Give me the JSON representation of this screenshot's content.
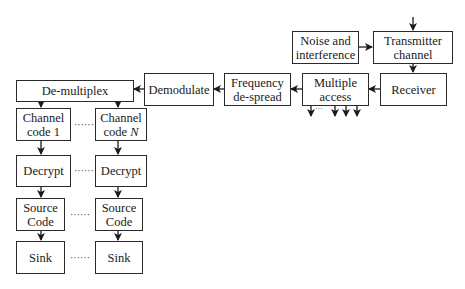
{
  "diagram": {
    "title": "",
    "nodes": {
      "transmitter_channel": "Transmitter\nchannel",
      "noise": "Noise and\ninterference",
      "receiver": "Receiver",
      "multiple_access": "Multiple\naccess",
      "frequency_despread": "Frequency\nde-spread",
      "demodulate": "Demodulate",
      "demultiplex": "De-multiplex",
      "channel_code_1": "Channel\ncode 1",
      "channel_code_n": "Channel\ncode N",
      "decrypt_1": "Decrypt",
      "decrypt_n": "Decrypt",
      "source_code_1": "Source\nCode",
      "source_code_n": "Source\nCode",
      "sink_1": "Sink",
      "sink_n": "Sink"
    },
    "ellipsis": "······",
    "edges": [
      {
        "from": "input",
        "to": "transmitter_channel"
      },
      {
        "from": "noise",
        "to": "transmitter_channel"
      },
      {
        "from": "transmitter_channel",
        "to": "receiver"
      },
      {
        "from": "receiver",
        "to": "multiple_access"
      },
      {
        "from": "multiple_access",
        "to": "frequency_despread"
      },
      {
        "from": "multiple_access",
        "to": "other_users"
      },
      {
        "from": "frequency_despread",
        "to": "demodulate"
      },
      {
        "from": "demodulate",
        "to": "demultiplex"
      },
      {
        "from": "demultiplex",
        "to": "channel_code_1"
      },
      {
        "from": "demultiplex",
        "to": "channel_code_n"
      },
      {
        "from": "channel_code_1",
        "to": "decrypt_1"
      },
      {
        "from": "channel_code_n",
        "to": "decrypt_n"
      },
      {
        "from": "decrypt_1",
        "to": "source_code_1"
      },
      {
        "from": "decrypt_n",
        "to": "source_code_n"
      },
      {
        "from": "source_code_1",
        "to": "sink_1"
      },
      {
        "from": "source_code_n",
        "to": "sink_n"
      }
    ]
  }
}
